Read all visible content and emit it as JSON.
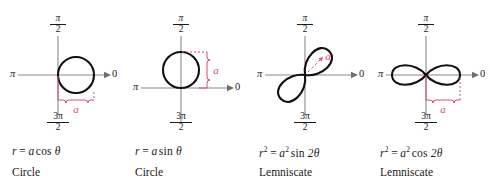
{
  "figure": {
    "axis_labels": {
      "right": "0",
      "left": "π",
      "top_numerator": "π",
      "top_denominator": "2",
      "bottom_numerator": "3π",
      "bottom_denominator": "2"
    },
    "annotation_color": "#e04a6a",
    "curve_color": "#111111",
    "axis_color": "#808080"
  },
  "panels": [
    {
      "id": "circle-cos",
      "shape": "circle-right",
      "annotation_label": "a",
      "annotation_kind": "horizontal-brace",
      "equation": {
        "lhs": "r",
        "equals": "=",
        "coefficient": "a",
        "function": "cos",
        "argument": "θ",
        "plain": "r = a cos θ"
      },
      "name": "Circle"
    },
    {
      "id": "circle-sin",
      "shape": "circle-up",
      "annotation_label": "a",
      "annotation_kind": "vertical-brace",
      "equation": {
        "lhs": "r",
        "equals": "=",
        "coefficient": "a",
        "function": "sin",
        "argument": "θ",
        "plain": "r = a sin θ"
      },
      "name": "Circle"
    },
    {
      "id": "lemniscate-sin",
      "shape": "lemniscate-diagonal",
      "annotation_label": "a",
      "annotation_kind": "dashed-radius",
      "equation": {
        "lhs": "r",
        "lhs_exp": "2",
        "equals": "=",
        "coefficient": "a",
        "coefficient_exp": "2",
        "function": "sin",
        "argument": "2θ",
        "plain": "r² = a² sin 2θ"
      },
      "name": "Lemniscate"
    },
    {
      "id": "lemniscate-cos",
      "shape": "lemniscate-horizontal",
      "annotation_label": "a",
      "annotation_kind": "horizontal-brace",
      "equation": {
        "lhs": "r",
        "lhs_exp": "2",
        "equals": "=",
        "coefficient": "a",
        "coefficient_exp": "2",
        "function": "cos",
        "argument": "2θ",
        "plain": "r² = a² cos 2θ"
      },
      "name": "Lemniscate"
    }
  ]
}
